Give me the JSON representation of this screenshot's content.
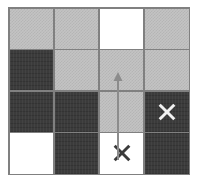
{
  "figure": {
    "background_color": "#ffffff",
    "width": 199,
    "height": 190
  },
  "grid": {
    "rows": 4,
    "columns": 4,
    "border_color": "#808080",
    "line_width": 1.5,
    "bounds": {
      "left": 8,
      "top": 7,
      "width": 182,
      "height": 168
    },
    "colors": {
      "gray": "#c3c3c3",
      "gray_dither": "#b5b5b5",
      "dark": "#3b3b3b",
      "white": "#ffffff"
    },
    "cells": [
      {
        "row": 1,
        "col": 1,
        "shade": "gray",
        "marker": "none"
      },
      {
        "row": 1,
        "col": 2,
        "shade": "gray",
        "marker": "none"
      },
      {
        "row": 1,
        "col": 3,
        "shade": "white",
        "marker": "none"
      },
      {
        "row": 1,
        "col": 4,
        "shade": "gray",
        "marker": "none"
      },
      {
        "row": 2,
        "col": 1,
        "shade": "dark",
        "marker": "none"
      },
      {
        "row": 2,
        "col": 2,
        "shade": "gray",
        "marker": "none"
      },
      {
        "row": 2,
        "col": 3,
        "shade": "gray",
        "marker": "none"
      },
      {
        "row": 2,
        "col": 4,
        "shade": "gray",
        "marker": "none"
      },
      {
        "row": 3,
        "col": 1,
        "shade": "dark",
        "marker": "none"
      },
      {
        "row": 3,
        "col": 2,
        "shade": "dark",
        "marker": "none"
      },
      {
        "row": 3,
        "col": 3,
        "shade": "gray",
        "marker": "none"
      },
      {
        "row": 3,
        "col": 4,
        "shade": "dark",
        "marker": "x-light"
      },
      {
        "row": 4,
        "col": 1,
        "shade": "white",
        "marker": "none"
      },
      {
        "row": 4,
        "col": 2,
        "shade": "dark",
        "marker": "none"
      },
      {
        "row": 4,
        "col": 3,
        "shade": "white",
        "marker": "x-dark"
      },
      {
        "row": 4,
        "col": 4,
        "shade": "dark",
        "marker": "none"
      }
    ]
  },
  "markers": {
    "x_light": {
      "name": "x-marker-light",
      "color": "#f2f2f2",
      "stroke_width": 3.2,
      "cell": "r3c4"
    },
    "x_dark": {
      "name": "x-marker-dark",
      "color": "#3b3b3b",
      "stroke_width": 3.2,
      "cell": "r4c3"
    }
  },
  "arrow": {
    "name": "movement-arrow",
    "color": "#8c8c8c",
    "stroke_width": 2.0,
    "direction": "up",
    "from_cell": "r4c3",
    "to_cell": "r2c3",
    "tail": {
      "x": 118,
      "y": 160
    },
    "tip": {
      "x": 118,
      "y": 72
    },
    "head_width": 9,
    "head_length": 9
  }
}
